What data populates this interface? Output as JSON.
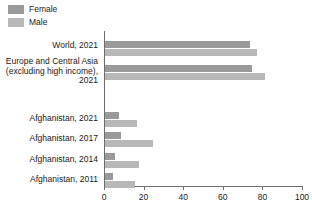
{
  "legend": {
    "position": "top-left",
    "items": [
      {
        "label": "Female",
        "color": "#9a9a9a",
        "icon": "legend-swatch-icon"
      },
      {
        "label": "Male",
        "color": "#b8b8b8",
        "icon": "legend-swatch-icon"
      }
    ]
  },
  "axis": {
    "ticks": [
      "0",
      "20",
      "40",
      "60",
      "80",
      "100"
    ]
  },
  "categories": [
    {
      "label": "World, 2021"
    },
    {
      "label": "Europe and Central Asia\n(excluding high income),\n2021"
    },
    {
      "label": "Afghanistan, 2021"
    },
    {
      "label": "Afghanistan, 2017"
    },
    {
      "label": "Afghanistan, 2014"
    },
    {
      "label": "Afghanistan, 2011"
    }
  ],
  "chart_data": {
    "type": "bar",
    "orientation": "horizontal",
    "title": "",
    "xlabel": "",
    "ylabel": "",
    "xlim": [
      0,
      100
    ],
    "xticks": [
      0,
      20,
      40,
      60,
      80,
      100
    ],
    "grid": false,
    "legend_position": "top-left",
    "categories": [
      "World, 2021",
      "Europe and Central Asia (excluding high income), 2021",
      "Afghanistan, 2021",
      "Afghanistan, 2017",
      "Afghanistan, 2014",
      "Afghanistan, 2011"
    ],
    "series": [
      {
        "name": "Female",
        "color": "#9a9a9a",
        "values": [
          73,
          74,
          7,
          8,
          5,
          4
        ]
      },
      {
        "name": "Male",
        "color": "#b8b8b8",
        "values": [
          77,
          81,
          16,
          24,
          17,
          15
        ]
      }
    ]
  }
}
